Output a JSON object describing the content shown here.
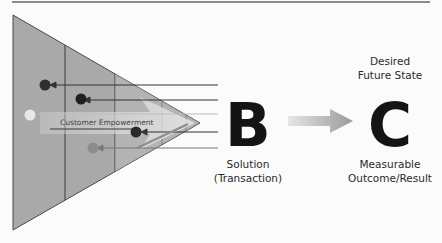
{
  "diagram": {
    "left_section": {
      "shape": "triangle",
      "arrow_label": "Customer Empowerment",
      "dots": [
        {
          "color": "#2e2e2e"
        },
        {
          "color": "#1f1f1f"
        },
        {
          "color": "#e8e8e8"
        },
        {
          "color": "#2a2a2a"
        },
        {
          "color": "#8c8c8c"
        }
      ]
    },
    "node_b": {
      "letter": "B",
      "label_line1": "Solution",
      "label_line2": "(Transaction)"
    },
    "connector": {
      "icon": "arrow-right-icon"
    },
    "node_c": {
      "letter": "C",
      "top_line1": "Desired",
      "top_line2": "Future State",
      "bottom_line1": "Measurable",
      "bottom_line2": "Outcome/Result"
    }
  }
}
